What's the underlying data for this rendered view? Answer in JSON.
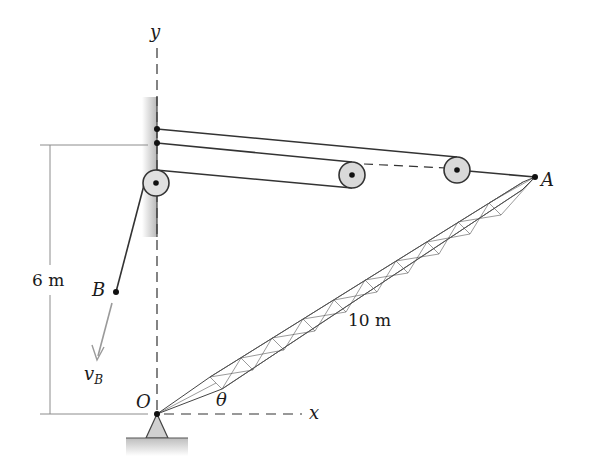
{
  "diagram": {
    "type": "mechanics-crane-boom",
    "labels": {
      "y_axis": "y",
      "x_axis": "x",
      "origin": "O",
      "point_A": "A",
      "point_B": "B",
      "velocity_main": "v",
      "velocity_sub": "B",
      "angle": "θ",
      "height_dim": "6 m",
      "boom_length": "10 m"
    },
    "points": {
      "O": [
        157,
        414
      ],
      "A": [
        535,
        177
      ],
      "B": [
        116,
        292
      ],
      "wall_pulley": [
        156,
        183
      ],
      "middle_pulley": [
        352,
        175
      ],
      "right_pulley": [
        457,
        170
      ]
    },
    "colors": {
      "line": "#333333",
      "pulley_fill": "#d9d9d9",
      "wall_shade": "#bdbdbd",
      "velocity_arrow": "#9a9a9a",
      "dim_line": "#8c8c8c"
    }
  }
}
